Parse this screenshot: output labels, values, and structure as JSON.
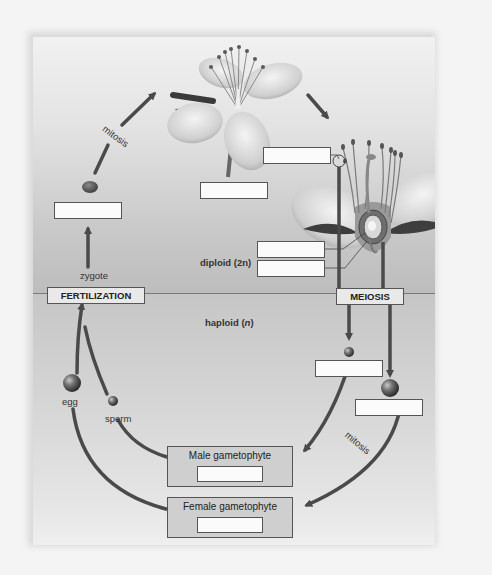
{
  "diagram": {
    "type": "plant life cycle (alternation of generations)",
    "regions": {
      "upper": "diploid (2n)",
      "lower_prefix": "haploid (",
      "lower_n": "n",
      "lower_suffix": ")"
    },
    "process_boxes": {
      "fertilization": "FERTILIZATION",
      "meiosis": "MEIOSIS"
    },
    "labels": {
      "mitosis_top": "mitosis",
      "mitosis_bottom": "mitosis",
      "zygote": "zygote",
      "egg": "egg",
      "sperm": "sperm"
    },
    "gametophytes": [
      {
        "title": "Male gametophyte",
        "answer": ""
      },
      {
        "title": "Female gametophyte",
        "answer": ""
      }
    ],
    "blank_fields": [
      {
        "id": "sporophyte-flower",
        "value": ""
      },
      {
        "id": "anther",
        "value": ""
      },
      {
        "id": "seed-embryo",
        "value": ""
      },
      {
        "id": "ovule",
        "value": ""
      },
      {
        "id": "ovary",
        "value": ""
      },
      {
        "id": "microspore",
        "value": ""
      },
      {
        "id": "megaspore",
        "value": ""
      }
    ],
    "colors": {
      "arrow": "#4a4a4a",
      "box_border": "#555555",
      "box_fill": "#fbfbfb",
      "process_fill": "#e9e9e9",
      "gametophyte_fill": "#cfcfcf",
      "divider": "#7a7a7a"
    }
  }
}
